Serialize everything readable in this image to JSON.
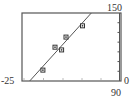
{
  "chart_data": {
    "type": "scatter",
    "title": "",
    "xlabel": "",
    "ylabel": "",
    "xlim": [
      0,
      90
    ],
    "ylim": [
      -25,
      150
    ],
    "grid": false,
    "legend": null,
    "x_ticks_step": 17,
    "y_ticks_step": 25,
    "window_labels": {
      "ymin": "-25",
      "ymax": "150",
      "xmin": "0",
      "xmax": "90"
    },
    "series": [
      {
        "name": "data",
        "kind": "scatter",
        "marker": "square",
        "x": [
          19,
          30,
          36,
          40,
          55
        ],
        "y": [
          3,
          62,
          55,
          88,
          117
        ]
      },
      {
        "name": "regression line",
        "kind": "line",
        "x": [
          7,
          63
        ],
        "y": [
          -25,
          150
        ]
      }
    ]
  },
  "colors": {
    "frame": "#555555",
    "line": "#555555",
    "marker": "#333333",
    "text": "#333333"
  }
}
